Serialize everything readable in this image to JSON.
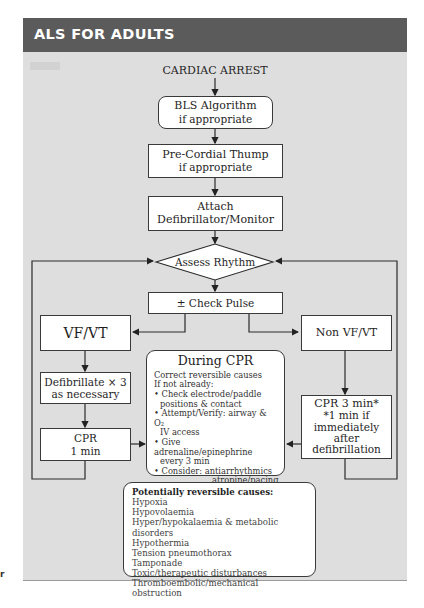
{
  "header": {
    "title": "ALS FOR ADULTS"
  },
  "flow": {
    "start": "CARDIAC ARREST",
    "bls": {
      "title": "BLS Algorithm",
      "sub": "if appropriate"
    },
    "thump": {
      "title": "Pre-Cordial Thump",
      "sub": "if appropriate"
    },
    "attach": {
      "line1": "Attach",
      "line2": "Defibrillator/Monitor"
    },
    "assess": "Assess Rhythm",
    "pulse": "± Check Pulse",
    "vfvt": "VF/VT",
    "non_vfvt": "Non VF/VT",
    "defib": {
      "line1": "Defibrillate × 3",
      "line2": "as necessary"
    },
    "cpr1": {
      "line1": "CPR",
      "line2": "1 min"
    },
    "cpr3": {
      "line1": "CPR 3 min*",
      "line2": "*1 min if",
      "line3": "immediately",
      "line4": "after",
      "line5": "defibrillation"
    }
  },
  "during_cpr": {
    "title": "During CPR",
    "lines": [
      "Correct reversible causes",
      "If not already:",
      "• Check electrode/paddle",
      "positions & contact",
      "• Attempt/Verify: airway & O₂",
      "IV access",
      "• Give adrenaline/epinephrine",
      "every 3 min",
      "• Consider: antiarrhythmics",
      "atropine/pacing",
      "buffers"
    ]
  },
  "reversible_causes": {
    "title": "Potentially reversible causes:",
    "items": [
      "Hypoxia",
      "Hypovolaemia",
      "Hyper/hypokalaemia & metabolic disorders",
      "Hypothermia",
      "Tension pneumothorax",
      "Tamponade",
      "Toxic/therapeutic disturbances",
      "Thromboembolic/mechanical obstruction"
    ]
  },
  "margin_fragment": "r",
  "colors": {
    "header_bg": "#5b5b5b",
    "panel_bg": "#dedede",
    "box_bg": "#ffffff",
    "line": "#2a2a2a"
  }
}
